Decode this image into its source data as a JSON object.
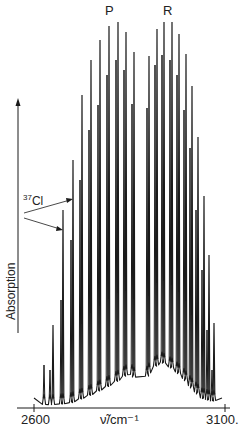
{
  "chart_data": {
    "type": "line",
    "title": "",
    "xlabel": "ν̃/cm⁻¹",
    "ylabel": "Absorption",
    "xlim": [
      2600,
      3100
    ],
    "x_ticks": [
      2600,
      3100
    ],
    "x_tick_labels": [
      "2600",
      "3100."
    ],
    "grid": false,
    "legend": null,
    "annotations": [
      {
        "text": "P",
        "role": "branch-label",
        "x_px": 110
      },
      {
        "text": "R",
        "role": "branch-label",
        "x_px": 168
      },
      {
        "text": "37Cl",
        "role": "isotope-label",
        "arrows_to_px": [
          63,
          73
        ]
      }
    ],
    "series": [
      {
        "name": "HCl (35Cl) lines",
        "peaks_px": [
          {
            "x": 53,
            "top": 325
          },
          {
            "x": 63,
            "top": 210
          },
          {
            "x": 73,
            "top": 160
          },
          {
            "x": 82,
            "top": 95
          },
          {
            "x": 91,
            "top": 60
          },
          {
            "x": 100,
            "top": 40
          },
          {
            "x": 109,
            "top": 26
          },
          {
            "x": 118,
            "top": 22
          },
          {
            "x": 126,
            "top": 32
          },
          {
            "x": 134,
            "top": 52
          },
          {
            "x": 149,
            "top": 56
          },
          {
            "x": 157,
            "top": 29
          },
          {
            "x": 164,
            "top": 22
          },
          {
            "x": 172,
            "top": 22
          },
          {
            "x": 179,
            "top": 34
          },
          {
            "x": 186,
            "top": 54
          },
          {
            "x": 192,
            "top": 86
          },
          {
            "x": 198,
            "top": 137
          },
          {
            "x": 204,
            "top": 196
          },
          {
            "x": 209,
            "top": 255
          },
          {
            "x": 214,
            "top": 323
          }
        ]
      },
      {
        "name": "H37Cl isotope lines",
        "peaks_px": [
          {
            "x": 44,
            "top": 365
          },
          {
            "x": 50,
            "top": 370
          },
          {
            "x": 61,
            "top": 300
          },
          {
            "x": 71,
            "top": 240
          },
          {
            "x": 80,
            "top": 180
          },
          {
            "x": 89,
            "top": 130
          },
          {
            "x": 98,
            "top": 105
          },
          {
            "x": 107,
            "top": 75
          },
          {
            "x": 116,
            "top": 60
          },
          {
            "x": 124,
            "top": 70
          },
          {
            "x": 132,
            "top": 104
          },
          {
            "x": 147,
            "top": 108
          },
          {
            "x": 155,
            "top": 65
          },
          {
            "x": 162,
            "top": 55
          },
          {
            "x": 170,
            "top": 60
          },
          {
            "x": 177,
            "top": 75
          },
          {
            "x": 184,
            "top": 110
          },
          {
            "x": 190,
            "top": 148
          },
          {
            "x": 196,
            "top": 210
          },
          {
            "x": 202,
            "top": 270
          },
          {
            "x": 207,
            "top": 330
          },
          {
            "x": 212,
            "top": 370
          }
        ]
      }
    ],
    "baseline_px": [
      [
        34,
        398
      ],
      [
        45,
        405
      ],
      [
        60,
        404
      ],
      [
        70,
        403
      ],
      [
        80,
        399
      ],
      [
        90,
        395
      ],
      [
        100,
        390
      ],
      [
        110,
        385
      ],
      [
        120,
        379
      ],
      [
        130,
        372
      ],
      [
        141,
        386
      ],
      [
        152,
        368
      ],
      [
        162,
        362
      ],
      [
        172,
        368
      ],
      [
        182,
        376
      ],
      [
        192,
        388
      ],
      [
        202,
        398
      ],
      [
        212,
        401
      ],
      [
        222,
        398
      ]
    ]
  },
  "labels": {
    "p_branch": "P",
    "r_branch": "R",
    "isotope_sup": "37",
    "isotope_sym": "Cl",
    "y_axis": "Absorption",
    "x_axis": "ν̃/cm⁻¹",
    "x_tick_left": "2600",
    "x_tick_right": "3100."
  },
  "colors": {
    "ink": "#1a1a1a",
    "background": "#ffffff"
  }
}
